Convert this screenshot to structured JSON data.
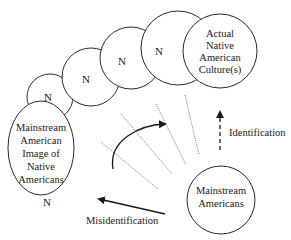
{
  "diagram": {
    "chain_nodes": [
      {
        "label": "N"
      },
      {
        "label": "N"
      },
      {
        "label": "N"
      },
      {
        "label": "N"
      }
    ],
    "actual_culture": {
      "lines": [
        "Actual",
        "Native",
        "American",
        "Culture(s)"
      ]
    },
    "mainstream_image": {
      "lines": [
        "Mainstream",
        "American",
        "Image of",
        "Native",
        "Americans"
      ],
      "below_label": "N"
    },
    "mainstream_americans": {
      "lines": [
        "Mainstream",
        "Americans"
      ]
    },
    "arrows": {
      "identification": "Identification",
      "misidentification": "Misidentification"
    },
    "colors": {
      "stroke": "#2a2a2a",
      "dotted": "#8a8a8a",
      "text": "#1a1a1a"
    }
  }
}
